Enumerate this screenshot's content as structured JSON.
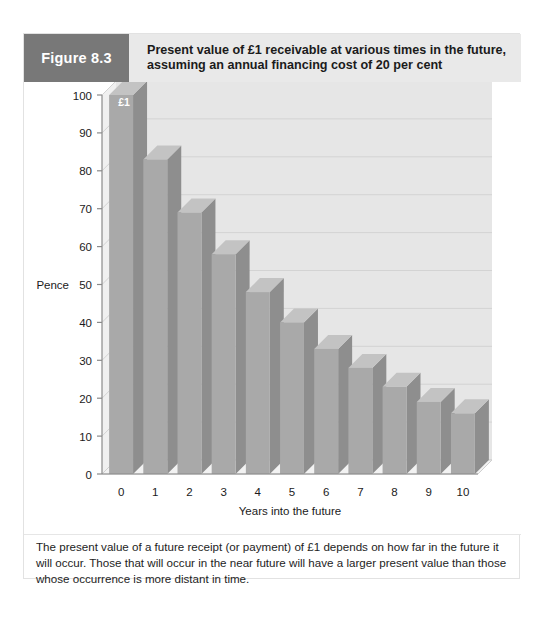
{
  "figure": {
    "number_label": "Figure 8.3",
    "title_line1": "Present value of £1 receivable at various times in the future,",
    "title_line2": "assuming an annual financing cost of 20 per cent",
    "caption": "The present value of a future receipt (or payment) of £1 depends on how far in the future it will occur. Those that will occur in the near future will have a larger present value than those whose occurrence is more distant in time."
  },
  "colors": {
    "badge_background": "#787878",
    "header_background": "#e9e9e9",
    "bar_front": "#a9a9a9",
    "bar_side": "#8e8e8e",
    "bar_top": "#c3c3c3",
    "plot_background": "#ededed",
    "plot_back_wall": "#e6e6e6",
    "gridline": "#d3d3d3",
    "axis": "#8a8a8a",
    "floor": "#f2f2f2",
    "text": "#1b1b1b"
  },
  "chart_data": {
    "type": "bar",
    "title": "Present value of £1 receivable at various times in the future, assuming an annual financing cost of 20 per cent",
    "xlabel": "Years into the future",
    "ylabel": "Pence",
    "categories": [
      "0",
      "1",
      "2",
      "3",
      "4",
      "5",
      "6",
      "7",
      "8",
      "9",
      "10"
    ],
    "values": [
      100,
      83,
      69,
      58,
      48,
      40,
      33,
      28,
      23,
      19,
      16
    ],
    "ylim": [
      0,
      100
    ],
    "yticks": [
      "100",
      "90",
      "80",
      "70",
      "60",
      "50",
      "40",
      "30",
      "20",
      "10",
      "0"
    ],
    "ytick_values": [
      100,
      90,
      80,
      70,
      60,
      50,
      40,
      30,
      20,
      10,
      0
    ],
    "grid": true,
    "legend": false,
    "annotations": [
      {
        "text": "£1",
        "attached_to_category": "0",
        "value": 100
      }
    ],
    "style": "3d-column"
  }
}
